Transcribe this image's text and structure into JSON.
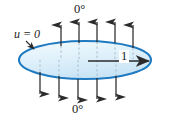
{
  "figure": {
    "name": "unit-disk-heat-diagram",
    "labels": {
      "top_boundary_temp": "0°",
      "bottom_boundary_temp": "0°",
      "boundary_condition": "u = 0",
      "radius": "1"
    },
    "colors": {
      "disk_stroke": "#1f7ac0",
      "disk_fill_light": "#eaf5fc",
      "disk_fill_mid": "#cfe8f7",
      "arrow_line": "#2b2b2b",
      "hidden_line": "#9fb6c4",
      "text": "#1a1a1a"
    },
    "geometry": {
      "ellipse_center_x": 85,
      "ellipse_center_y": 60,
      "ellipse_radius_x": 66,
      "ellipse_radius_y": 19,
      "top_arrow_count": 5,
      "bottom_arrow_count": 5,
      "top_arrow_x": [
        61,
        79,
        97,
        115,
        133
      ],
      "bottom_arrow_x": [
        40,
        59,
        78,
        97,
        116
      ],
      "radius_arrow_from_x": 88,
      "radius_arrow_to_x": 151,
      "radius_arrow_y": 61
    },
    "icon_names": {
      "up_arrow": "flux-arrow-up-icon",
      "down_arrow": "flux-arrow-down-icon",
      "radius_arrow": "radius-arrow-right-icon",
      "leader": "leader-line-icon",
      "disk": "disk-shape-icon"
    }
  }
}
